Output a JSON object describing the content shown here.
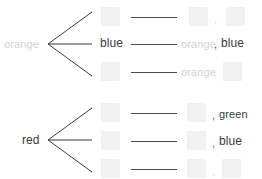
{
  "diagram": {
    "type": "branching-tree",
    "colors": {
      "ink_dark": "#3a3a3c",
      "ink_faded": "#d2d2d2",
      "chip_fill": "#f1f1f1",
      "line": "#4a4a4c"
    },
    "groups": [
      {
        "id": "group-orange",
        "root_label": "orange",
        "root_state": "faded",
        "branch_count": 3,
        "branches": [
          {
            "id": "branch-orange-1",
            "node_label": "",
            "node_state": "redacted",
            "result_parts": [
              {
                "text": "",
                "state": "redacted"
              },
              {
                "text": ",",
                "state": "faded"
              },
              {
                "text": "",
                "state": "redacted"
              }
            ]
          },
          {
            "id": "branch-orange-2",
            "node_label": "blue",
            "node_state": "visible",
            "result_parts": [
              {
                "text": "orange",
                "state": "faded"
              },
              {
                "text": ",",
                "state": "visible"
              },
              {
                "text": "blue",
                "state": "visible"
              }
            ]
          },
          {
            "id": "branch-orange-3",
            "node_label": "",
            "node_state": "redacted",
            "result_parts": [
              {
                "text": "orange",
                "state": "faded"
              },
              {
                "text": ",",
                "state": "faded"
              },
              {
                "text": "",
                "state": "redacted"
              }
            ]
          }
        ]
      },
      {
        "id": "group-red",
        "root_label": "red",
        "root_state": "visible",
        "branch_count": 3,
        "branches": [
          {
            "id": "branch-red-1",
            "node_label": "",
            "node_state": "redacted",
            "result_parts": [
              {
                "text": "",
                "state": "redacted"
              },
              {
                "text": ",",
                "state": "visible"
              },
              {
                "text": "green",
                "state": "visible"
              }
            ]
          },
          {
            "id": "branch-red-2",
            "node_label": "",
            "node_state": "redacted",
            "result_parts": [
              {
                "text": "",
                "state": "redacted"
              },
              {
                "text": ",",
                "state": "visible"
              },
              {
                "text": "blue",
                "state": "visible"
              }
            ]
          },
          {
            "id": "branch-red-3",
            "node_label": "",
            "node_state": "redacted",
            "result_parts": [
              {
                "text": "",
                "state": "redacted"
              },
              {
                "text": ",",
                "state": "faded"
              },
              {
                "text": "",
                "state": "redacted"
              }
            ]
          }
        ]
      }
    ]
  }
}
